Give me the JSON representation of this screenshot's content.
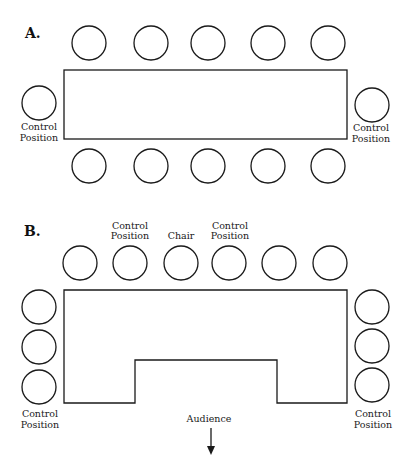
{
  "diagram": {
    "panel_a": {
      "label": "A.",
      "table": {
        "shape": "rectangle",
        "x": 64,
        "y": 70,
        "width": 283,
        "height": 69
      },
      "seats_top": [
        {
          "cx": 89,
          "cy": 43
        },
        {
          "cx": 151,
          "cy": 43
        },
        {
          "cx": 208,
          "cy": 43
        },
        {
          "cx": 268,
          "cy": 43
        },
        {
          "cx": 328,
          "cy": 43
        }
      ],
      "seats_bottom": [
        {
          "cx": 89,
          "cy": 166
        },
        {
          "cx": 151,
          "cy": 166
        },
        {
          "cx": 208,
          "cy": 166
        },
        {
          "cx": 268,
          "cy": 166
        },
        {
          "cx": 328,
          "cy": 166
        }
      ],
      "seat_left": {
        "cx": 39,
        "cy": 103,
        "label_line1": "Control",
        "label_line2": "Position"
      },
      "seat_right": {
        "cx": 372,
        "cy": 105,
        "label_line1": "Control",
        "label_line2": "Position"
      }
    },
    "panel_b": {
      "label": "B.",
      "table": {
        "shape": "u-shape",
        "points": "64,60 347,60 347,173 277,173 277,130 135,130 135,173 64,173"
      },
      "top_labels": [
        {
          "x": 130,
          "line1": "Control",
          "line2": "Position"
        },
        {
          "x": 181,
          "line1": "",
          "line2": "Chair"
        },
        {
          "x": 230,
          "line1": "Control",
          "line2": "Position"
        }
      ],
      "seats_top": [
        {
          "cx": 80,
          "cy": 263
        },
        {
          "cx": 130,
          "cy": 263
        },
        {
          "cx": 181,
          "cy": 263
        },
        {
          "cx": 229,
          "cy": 263
        },
        {
          "cx": 279,
          "cy": 263
        },
        {
          "cx": 330,
          "cy": 263
        }
      ],
      "seats_left": [
        {
          "cx": 39,
          "cy": 307
        },
        {
          "cx": 39,
          "cy": 347
        },
        {
          "cx": 39,
          "cy": 387
        }
      ],
      "seats_right": [
        {
          "cx": 372,
          "cy": 307
        },
        {
          "cx": 372,
          "cy": 347
        },
        {
          "cx": 372,
          "cy": 387
        }
      ],
      "left_label": {
        "line1": "Control",
        "line2": "Position"
      },
      "right_label": {
        "line1": "Control",
        "line2": "Position"
      },
      "audience_label": "Audience",
      "audience_arrow": "down-arrow"
    },
    "seat_radius": 17,
    "stroke_color": "#1a1a1a"
  }
}
